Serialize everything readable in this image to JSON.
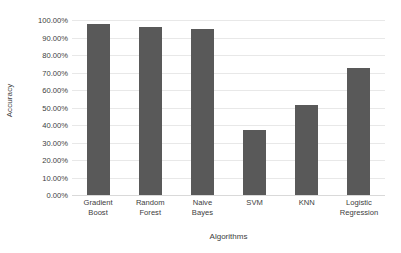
{
  "chart_data": {
    "type": "bar",
    "title": "",
    "xlabel": "Algorithms",
    "ylabel": "Accuracy",
    "categories": [
      "Gradient Boost",
      "Random Forest",
      "Naive Bayes",
      "SVM",
      "KNN",
      "Logistic Regression"
    ],
    "values": [
      98.0,
      96.0,
      95.0,
      37.0,
      51.5,
      72.5
    ],
    "ylim": [
      0,
      100
    ],
    "ytick_labels": [
      "100.00%",
      "90.00%",
      "80.00%",
      "70.00%",
      "60.00%",
      "50.00%",
      "40.00%",
      "30.00%",
      "20.00%",
      "10.00%",
      "0.00%"
    ],
    "ytick_values": [
      100,
      90,
      80,
      70,
      60,
      50,
      40,
      30,
      20,
      10,
      0
    ],
    "grid": true,
    "legend": false,
    "bar_color": "#595959",
    "grid_color": "#e8e8e8",
    "background_color": "#ffffff",
    "text_color": "#3d3d3d"
  }
}
